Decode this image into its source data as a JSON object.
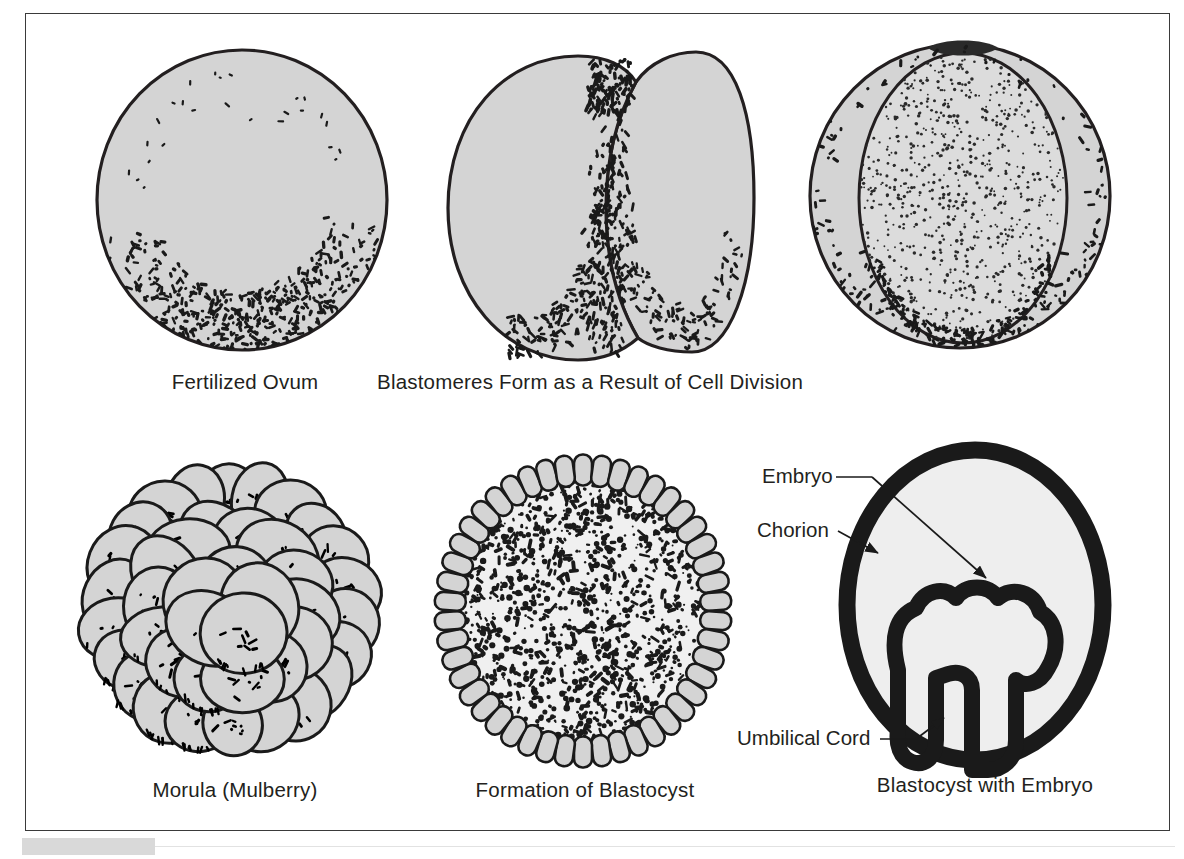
{
  "figure": {
    "title_visible": false,
    "background": "#ffffff",
    "border_color": "#3a3a3a",
    "cell_fill": "#d4d4d4",
    "cell_fill_light": "#e8e8e8",
    "ink": "#231f20",
    "footer_bar_color": "#d9d9d9"
  },
  "panels": [
    {
      "id": "fertilized-ovum",
      "caption": "Fertilized Ovum",
      "stage": 1,
      "description": "Single round cell with dense stippling gathered in the lower crescent"
    },
    {
      "id": "blastomeres",
      "caption": "Blastomeres Form as a Result of Cell Division",
      "stage": 2,
      "description": "Cell divided into two lobes by a vertical cleavage furrow"
    },
    {
      "id": "blastomeres-four",
      "caption": "",
      "stage": 3,
      "description": "Further cleavage, large inner oval with fine dotted stipple flanked by crescent lobes"
    },
    {
      "id": "morula",
      "caption": "Morula (Mulberry)",
      "stage": 4,
      "description": "Solid mulberry-like cluster of many overlapping rounded cells"
    },
    {
      "id": "blastocyst",
      "caption": "Formation of Blastocyst",
      "stage": 5,
      "description": "Hollow sphere rimmed by radial columnar trophoblast cells around a mottled inner mass"
    },
    {
      "id": "blastocyst-embryo",
      "caption": "Blastocyst with Embryo",
      "stage": 6,
      "description": "Thick dark chorion oval enclosing a mushroom-shaped embryo joined to the wall by the umbilical cord"
    }
  ],
  "callouts": [
    {
      "id": "embryo",
      "label": "Embryo"
    },
    {
      "id": "chorion",
      "label": "Chorion"
    },
    {
      "id": "umbilical-cord",
      "label": "Umbilical Cord"
    }
  ]
}
